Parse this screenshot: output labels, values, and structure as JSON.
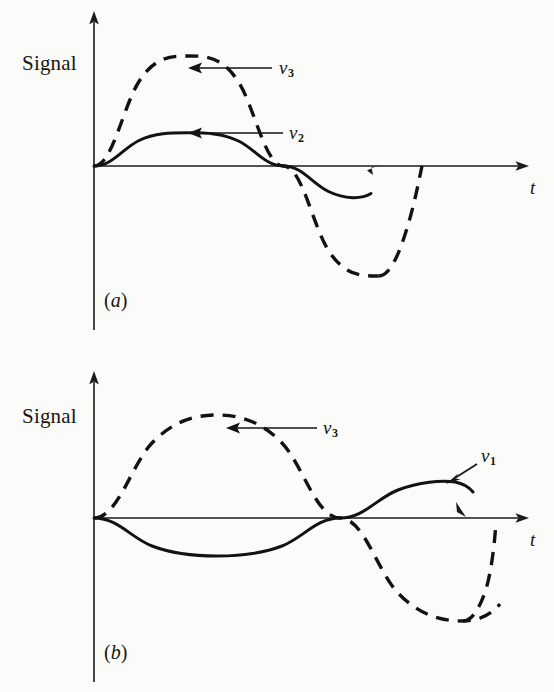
{
  "figure": {
    "background_color": "#fbfbfa",
    "ink_color": "#121210",
    "width": 554,
    "height": 692,
    "panels": [
      {
        "id": "a",
        "caption": "(a)",
        "caption_letter": "a",
        "y_axis_label": "Signal",
        "x_axis_label": "t",
        "annotations": [
          {
            "label": "v",
            "subscript": "3",
            "target": "dashed-curve-v3"
          },
          {
            "label": "v",
            "subscript": "2",
            "target": "solid-curve-v2"
          }
        ]
      },
      {
        "id": "b",
        "caption": "(b)",
        "caption_letter": "b",
        "y_axis_label": "Signal",
        "x_axis_label": "t",
        "annotations": [
          {
            "label": "v",
            "subscript": "3",
            "target": "dashed-curve-v3"
          },
          {
            "label": "v",
            "subscript": "1",
            "target": "solid-curve-v1"
          }
        ]
      }
    ]
  },
  "chart_data": [
    {
      "type": "line",
      "panel": "a",
      "title": "",
      "xlabel": "t",
      "ylabel": "Signal",
      "grid": false,
      "legend": "inline-arrow-annotations",
      "axis_style": "arrow-headed axes, no tick marks, no tick labels",
      "xlim": [
        0,
        1.18
      ],
      "ylim": [
        -1.05,
        1.05
      ],
      "series": [
        {
          "name": "v3",
          "label": "v₃",
          "style": "dashed",
          "waveform": "sine",
          "amplitude": 0.85,
          "periods": 1,
          "phase_deg": 0,
          "x_start": 0.0,
          "x_end": 1.0,
          "x": [
            0.0,
            0.125,
            0.25,
            0.375,
            0.5,
            0.625,
            0.75,
            0.875,
            1.0
          ],
          "y": [
            0.0,
            0.601,
            0.85,
            0.601,
            0.0,
            -0.601,
            -0.85,
            -0.601,
            0.0
          ]
        },
        {
          "name": "v2",
          "label": "v₂",
          "style": "solid",
          "waveform": "sine",
          "amplitude": 0.32,
          "periods": 1,
          "phase_deg": 0,
          "x_start": 0.0,
          "x_end": 1.0,
          "x": [
            0.0,
            0.125,
            0.25,
            0.375,
            0.5,
            0.625,
            0.75,
            0.875,
            1.0
          ],
          "y": [
            0.0,
            0.226,
            0.32,
            0.226,
            0.0,
            -0.226,
            -0.32,
            -0.226,
            0.0
          ]
        }
      ]
    },
    {
      "type": "line",
      "panel": "b",
      "title": "",
      "xlabel": "t",
      "ylabel": "Signal",
      "grid": false,
      "legend": "inline-arrow-annotations",
      "axis_style": "arrow-headed axes, no tick marks, no tick labels",
      "xlim": [
        0,
        1.18
      ],
      "ylim": [
        -1.05,
        1.05
      ],
      "series": [
        {
          "name": "v3",
          "label": "v₃",
          "style": "dashed",
          "waveform": "sine",
          "amplitude": 0.85,
          "periods": 1,
          "phase_deg": 0,
          "x_start": 0.0,
          "x_end": 1.0,
          "x": [
            0.0,
            0.125,
            0.25,
            0.375,
            0.5,
            0.625,
            0.75,
            0.875,
            1.0
          ],
          "y": [
            0.0,
            0.601,
            0.85,
            0.601,
            0.0,
            -0.601,
            -0.85,
            -0.601,
            0.0
          ]
        },
        {
          "name": "v1",
          "label": "v₁",
          "style": "solid",
          "waveform": "inverted-sine",
          "amplitude": 0.32,
          "periods": 1,
          "phase_deg": 180,
          "x_start": 0.0,
          "x_end": 1.0,
          "x": [
            0.0,
            0.125,
            0.25,
            0.375,
            0.5,
            0.625,
            0.75,
            0.875,
            1.0
          ],
          "y": [
            0.0,
            -0.226,
            -0.32,
            -0.226,
            0.0,
            0.226,
            0.32,
            0.226,
            0.0
          ]
        }
      ]
    }
  ]
}
